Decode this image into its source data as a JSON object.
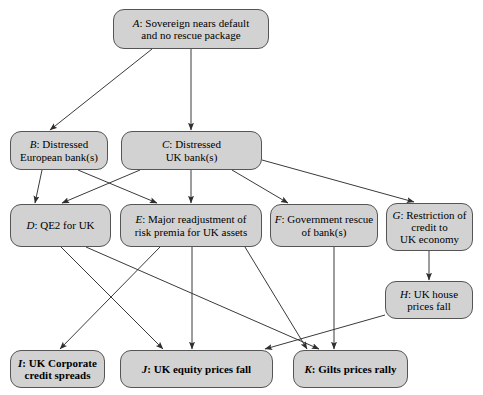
{
  "diagram": {
    "canvas": {
      "width": 483,
      "height": 395,
      "background": "#ffffff"
    },
    "style": {
      "node_fill": "#d2d2d2",
      "node_border": "#555555",
      "edge_color": "#3a3a3a",
      "text_color": "#000000"
    },
    "nodes": [
      {
        "id": "A",
        "key": "A",
        "label": "Sovereign nears default and no rescue package",
        "lines": [
          "Sovereign nears default",
          "and no rescue package"
        ],
        "x": 113,
        "y": 9,
        "w": 156,
        "h": 40,
        "bold": false
      },
      {
        "id": "B",
        "key": "B",
        "label": "Distressed European bank(s)",
        "lines": [
          "Distressed",
          "European bank(s)"
        ],
        "x": 10,
        "y": 131,
        "w": 98,
        "h": 39,
        "bold": false
      },
      {
        "id": "C",
        "key": "C",
        "label": "Distressed UK bank(s)",
        "lines": [
          "Distressed",
          "UK bank(s)"
        ],
        "x": 121,
        "y": 131,
        "w": 141,
        "h": 39,
        "bold": false
      },
      {
        "id": "D",
        "key": "D",
        "label": "QE2 for UK",
        "lines": [
          "QE2 for UK"
        ],
        "x": 10,
        "y": 204,
        "w": 101,
        "h": 43,
        "bold": false
      },
      {
        "id": "E",
        "key": "E",
        "label": "Major readjustment of risk premia for UK assets",
        "lines": [
          "Major readjustment of",
          "risk premia for UK assets"
        ],
        "x": 120,
        "y": 204,
        "w": 142,
        "h": 43,
        "bold": false
      },
      {
        "id": "F",
        "key": "F",
        "label": "Government rescue of bank(s)",
        "lines": [
          "Government rescue",
          "of bank(s)"
        ],
        "x": 270,
        "y": 204,
        "w": 108,
        "h": 43,
        "bold": false
      },
      {
        "id": "G",
        "key": "G",
        "label": "Restriction of credit to UK economy",
        "lines": [
          "Restriction of",
          "credit to",
          "UK economy"
        ],
        "x": 386,
        "y": 203,
        "w": 87,
        "h": 48,
        "bold": false
      },
      {
        "id": "H",
        "key": "H",
        "label": "UK house prices fall",
        "lines": [
          "UK house",
          "prices fall"
        ],
        "x": 385,
        "y": 281,
        "w": 88,
        "h": 38,
        "bold": false
      },
      {
        "id": "I",
        "key": "I",
        "label": "UK Corporate credit spreads",
        "lines": [
          "UK Corporate",
          "credit spreads"
        ],
        "x": 10,
        "y": 350,
        "w": 95,
        "h": 38,
        "bold": true
      },
      {
        "id": "J",
        "key": "J",
        "label": "UK equity prices fall",
        "lines": [
          "UK equity prices fall"
        ],
        "x": 120,
        "y": 350,
        "w": 153,
        "h": 38,
        "bold": true
      },
      {
        "id": "K",
        "key": "K",
        "label": "Gilts prices rally",
        "lines": [
          "Gilts prices rally"
        ],
        "x": 293,
        "y": 350,
        "w": 115,
        "h": 38,
        "bold": true
      }
    ],
    "edges": [
      {
        "from": "A",
        "to": "B",
        "x1": 152,
        "y1": 49,
        "x2": 50,
        "y2": 130
      },
      {
        "from": "A",
        "to": "C",
        "x1": 191,
        "y1": 49,
        "x2": 191,
        "y2": 130
      },
      {
        "from": "B",
        "to": "E",
        "x1": 78,
        "y1": 170,
        "x2": 157,
        "y2": 203
      },
      {
        "from": "B",
        "to": "D",
        "x1": 42,
        "y1": 170,
        "x2": 35,
        "y2": 203
      },
      {
        "from": "C",
        "to": "D",
        "x1": 140,
        "y1": 170,
        "x2": 62,
        "y2": 203
      },
      {
        "from": "C",
        "to": "E",
        "x1": 191,
        "y1": 170,
        "x2": 191,
        "y2": 203
      },
      {
        "from": "C",
        "to": "F",
        "x1": 232,
        "y1": 170,
        "x2": 288,
        "y2": 203
      },
      {
        "from": "C",
        "to": "G",
        "x1": 262,
        "y1": 160,
        "x2": 414,
        "y2": 202
      },
      {
        "from": "D",
        "to": "J",
        "x1": 61,
        "y1": 247,
        "x2": 163,
        "y2": 349
      },
      {
        "from": "D",
        "to": "K",
        "x1": 86,
        "y1": 247,
        "x2": 319,
        "y2": 349
      },
      {
        "from": "E",
        "to": "I",
        "x1": 160,
        "y1": 247,
        "x2": 60,
        "y2": 349
      },
      {
        "from": "E",
        "to": "J",
        "x1": 192,
        "y1": 247,
        "x2": 192,
        "y2": 349
      },
      {
        "from": "E",
        "to": "K",
        "x1": 245,
        "y1": 247,
        "x2": 307,
        "y2": 349
      },
      {
        "from": "F",
        "to": "K",
        "x1": 334,
        "y1": 247,
        "x2": 334,
        "y2": 349
      },
      {
        "from": "G",
        "to": "H",
        "x1": 429,
        "y1": 251,
        "x2": 429,
        "y2": 280
      },
      {
        "from": "H",
        "to": "J",
        "x1": 385,
        "y1": 315,
        "x2": 265,
        "y2": 349
      }
    ]
  }
}
